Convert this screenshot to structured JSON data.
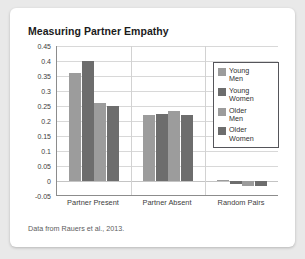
{
  "card": {
    "title": "Measuring Partner Empathy",
    "source_note": "Data from Rauers et al., 2013."
  },
  "chart_data": {
    "type": "bar",
    "title": "Measuring Partner Empathy",
    "xlabel": "",
    "ylabel": "",
    "categories": [
      "Partner Present",
      "Partner Absent",
      "Random Pairs"
    ],
    "series": [
      {
        "name": "Young Men",
        "color": "#9c9c9c",
        "values": [
          0.36,
          0.22,
          0.005
        ]
      },
      {
        "name": "Young Women",
        "color": "#6d6d6d",
        "values": [
          0.4,
          0.225,
          -0.01
        ]
      },
      {
        "name": "Older Men",
        "color": "#9c9c9c",
        "values": [
          0.26,
          0.235,
          -0.015
        ]
      },
      {
        "name": "Older Women",
        "color": "#6d6d6d",
        "values": [
          0.25,
          0.22,
          -0.018
        ]
      }
    ],
    "ylim": [
      -0.05,
      0.45
    ],
    "yticks": [
      0.45,
      0.4,
      0.35,
      0.3,
      0.25,
      0.2,
      0.15,
      0.1,
      0.05,
      0,
      -0.05
    ],
    "ytick_labels": [
      "0.45",
      "0.4",
      "0.35",
      "0.3",
      "0.25",
      "0.2",
      "0.15",
      "0.1",
      "0.05",
      "0",
      "-0.05"
    ],
    "grid": true,
    "legend_position": "top-right"
  },
  "legend": {
    "items": [
      {
        "label_line1": "Young",
        "label_line2": "Men",
        "color": "#9c9c9c"
      },
      {
        "label_line1": "Young",
        "label_line2": "Women",
        "color": "#6d6d6d"
      },
      {
        "label_line1": "Older",
        "label_line2": "Men",
        "color": "#9c9c9c"
      },
      {
        "label_line1": "Older",
        "label_line2": "Women",
        "color": "#6d6d6d"
      }
    ]
  }
}
